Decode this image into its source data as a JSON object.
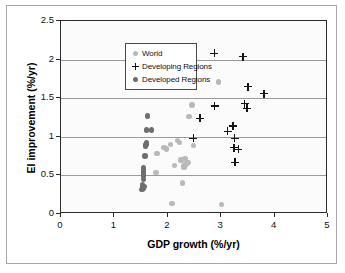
{
  "chart_data": {
    "type": "scatter",
    "title": "",
    "xlabel": "GDP growth (%/yr)",
    "ylabel": "EI improvement (%/yr)",
    "xlim": [
      0,
      5
    ],
    "ylim": [
      0,
      2.5
    ],
    "xticks": [
      0,
      1,
      2,
      3,
      4,
      5
    ],
    "yticks": [
      0,
      0.5,
      1,
      1.5,
      2,
      2.5
    ],
    "xtick_labels": [
      "0",
      "1",
      "2",
      "3",
      "4",
      "5"
    ],
    "ytick_labels": [
      "0",
      "0.5",
      "1",
      "1.5",
      "2",
      "2.5"
    ],
    "grid": "horizontal",
    "legend_position": "top-left",
    "colors": {
      "world": "#b9b9b9",
      "developing": "#151515",
      "developed": "#6e6e6e",
      "gridline": "#9a9a9a",
      "axis": "#2b2b2b",
      "plot_background": "#fbfbfb"
    },
    "series": [
      {
        "name": "World",
        "marker": "circle",
        "color": "#b9b9b9",
        "points": [
          [
            1.78,
            0.54
          ],
          [
            1.8,
            0.78
          ],
          [
            1.93,
            0.86
          ],
          [
            1.98,
            0.84
          ],
          [
            2.05,
            0.9
          ],
          [
            2.08,
            0.14
          ],
          [
            2.13,
            0.63
          ],
          [
            2.18,
            0.95
          ],
          [
            2.22,
            0.93
          ],
          [
            2.25,
            0.7
          ],
          [
            2.27,
            0.4
          ],
          [
            2.29,
            0.62
          ],
          [
            2.3,
            0.6
          ],
          [
            2.32,
            0.72
          ],
          [
            2.34,
            0.65
          ],
          [
            2.38,
            0.67
          ],
          [
            2.4,
            1.26
          ],
          [
            2.45,
            1.41
          ],
          [
            2.48,
            0.89
          ],
          [
            2.95,
            1.71
          ],
          [
            3.0,
            0.12
          ]
        ]
      },
      {
        "name": "Developing Regions",
        "marker": "plus",
        "color": "#151515",
        "points": [
          [
            2.48,
            0.98
          ],
          [
            2.6,
            1.24
          ],
          [
            2.87,
            2.08
          ],
          [
            2.88,
            1.4
          ],
          [
            3.12,
            1.07
          ],
          [
            3.22,
            1.14
          ],
          [
            3.24,
            0.86
          ],
          [
            3.25,
            0.98
          ],
          [
            3.26,
            0.67
          ],
          [
            3.32,
            0.84
          ],
          [
            3.41,
            2.04
          ],
          [
            3.44,
            1.43
          ],
          [
            3.48,
            1.37
          ],
          [
            3.5,
            1.65
          ],
          [
            3.8,
            1.56
          ]
        ]
      },
      {
        "name": "Developed Regions",
        "marker": "circle",
        "color": "#6e6e6e",
        "points": [
          [
            1.52,
            0.32
          ],
          [
            1.53,
            0.35
          ],
          [
            1.53,
            0.38
          ],
          [
            1.54,
            0.45
          ],
          [
            1.54,
            0.49
          ],
          [
            1.54,
            0.53
          ],
          [
            1.55,
            0.56
          ],
          [
            1.55,
            0.58
          ],
          [
            1.55,
            0.6
          ],
          [
            1.55,
            0.33
          ],
          [
            1.56,
            0.36
          ],
          [
            1.57,
            0.75
          ],
          [
            1.58,
            0.88
          ],
          [
            1.59,
            0.9
          ],
          [
            1.6,
            0.92
          ],
          [
            1.6,
            1.09
          ],
          [
            1.62,
            1.27
          ],
          [
            1.69,
            1.09
          ]
        ]
      }
    ]
  },
  "legend": {
    "items": [
      {
        "label": "World",
        "marker": "circle",
        "color": "#b9b9b9"
      },
      {
        "label": "Developing Regions",
        "marker": "plus",
        "color": "#151515"
      },
      {
        "label": "Developed Regions",
        "marker": "circle",
        "color": "#6e6e6e"
      }
    ]
  }
}
